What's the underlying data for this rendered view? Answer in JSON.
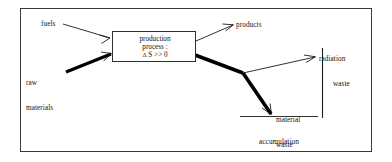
{
  "figure": {
    "type": "flow-diagram",
    "frame": {
      "stroke_color": "#3a3a3a",
      "background": "#ffffff"
    }
  },
  "process_box": {
    "line_1": "production",
    "line_2": "process :",
    "line_3_symbol": "Δ",
    "line_3_rest": " S >> 0",
    "line_3_full": "Δ S >> 0",
    "border_color": "#2e2e2e"
  },
  "inputs": [
    {
      "id": "fuels",
      "label": "fuels",
      "arrow_style": "thin",
      "description": "thin arrow entering process box upper left"
    },
    {
      "id": "raw-materials",
      "label": "raw\nmaterials",
      "label_line_1": "raw",
      "label_line_2": "materials",
      "arrow_style": "thick",
      "description": "thick arrow entering process box lower left"
    }
  ],
  "outputs": [
    {
      "id": "products",
      "label": "products",
      "arrow_style": "thin",
      "description": "thin arrow leaving process box upper right"
    },
    {
      "id": "radiation",
      "label": "radiation",
      "arrow_style": "thin",
      "description": "thin arrow branching upward from waste node"
    },
    {
      "id": "material-waste",
      "label": "material\nwaste",
      "label_line_1": "material",
      "label_line_2": "waste",
      "arrow_style": "thick",
      "description": "thick arrow descending from waste node to sink line"
    }
  ],
  "sink": {
    "line_1": "accumulation",
    "line_2": "in sinks",
    "full": "accumulation in sinks"
  },
  "bracket": {
    "label": "waste",
    "orientation": "vertical",
    "covers": [
      "radiation",
      "material-waste"
    ]
  },
  "colors": {
    "ink": "#111111",
    "thin_stroke": "#1a1a1a",
    "thick_stroke": "#000000",
    "frame": "#3a3a3a",
    "paper": "#ffffff"
  }
}
